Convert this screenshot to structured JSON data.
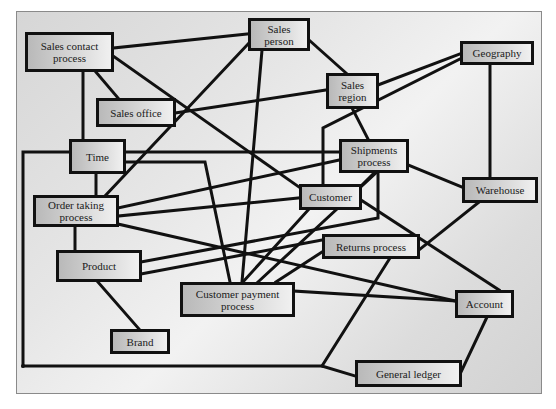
{
  "diagram": {
    "type": "entity-relationship",
    "nodes": {
      "sales_contact_process": {
        "label": "Sales contact\nprocess"
      },
      "sales_person": {
        "label": "Sales\nperson"
      },
      "geography": {
        "label": "Geography"
      },
      "sales_region": {
        "label": "Sales\nregion"
      },
      "sales_office": {
        "label": "Sales office"
      },
      "time": {
        "label": "Time"
      },
      "shipments_process": {
        "label": "Shipments\nprocess"
      },
      "order_taking_process": {
        "label": "Order taking\nprocess"
      },
      "customer": {
        "label": "Customer"
      },
      "warehouse": {
        "label": "Warehouse"
      },
      "returns_process": {
        "label": "Returns process"
      },
      "product": {
        "label": "Product"
      },
      "customer_payment_process": {
        "label": "Customer payment\nprocess"
      },
      "account": {
        "label": "Account"
      },
      "brand": {
        "label": "Brand"
      },
      "general_ledger": {
        "label": "General ledger"
      }
    },
    "edges": [
      [
        "sales_contact_process",
        "sales_person"
      ],
      [
        "sales_contact_process",
        "sales_office"
      ],
      [
        "sales_contact_process",
        "time"
      ],
      [
        "sales_contact_process",
        "customer"
      ],
      [
        "sales_person",
        "sales_region"
      ],
      [
        "sales_person",
        "order_taking_process"
      ],
      [
        "sales_person",
        "customer_payment_process"
      ],
      [
        "sales_office",
        "sales_region"
      ],
      [
        "sales_region",
        "geography"
      ],
      [
        "sales_region",
        "shipments_process"
      ],
      [
        "geography",
        "customer"
      ],
      [
        "geography",
        "warehouse"
      ],
      [
        "time",
        "order_taking_process"
      ],
      [
        "time",
        "shipments_process"
      ],
      [
        "time",
        "customer_payment_process"
      ],
      [
        "time",
        "general_ledger"
      ],
      [
        "order_taking_process",
        "shipments_process"
      ],
      [
        "order_taking_process",
        "customer"
      ],
      [
        "order_taking_process",
        "product"
      ],
      [
        "order_taking_process",
        "account"
      ],
      [
        "shipments_process",
        "warehouse"
      ],
      [
        "shipments_process",
        "customer_payment_process"
      ],
      [
        "shipments_process",
        "product"
      ],
      [
        "customer",
        "customer_payment_process"
      ],
      [
        "customer",
        "account"
      ],
      [
        "warehouse",
        "returns_process"
      ],
      [
        "returns_process",
        "product"
      ],
      [
        "returns_process",
        "customer_payment_process"
      ],
      [
        "returns_process",
        "general_ledger"
      ],
      [
        "product",
        "brand"
      ],
      [
        "customer_payment_process",
        "account"
      ],
      [
        "account",
        "general_ledger"
      ]
    ]
  }
}
